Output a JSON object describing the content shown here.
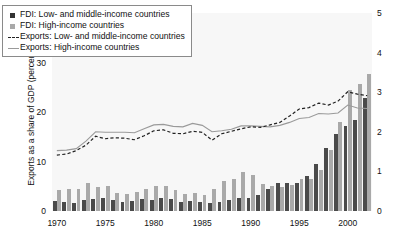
{
  "figure": {
    "background": "#ffffff",
    "plot_background": "#f7f7f7"
  },
  "colors": {
    "fdi_low_middle": "#4a4a4a",
    "fdi_high": "#a9a9a9",
    "exports_low_middle": "#222222",
    "exports_high": "#9a9a9a"
  },
  "legend": {
    "items": [
      {
        "label": "FDI: Low- and middle-income countries",
        "marker": "square-dark-icon"
      },
      {
        "label": "FDI: High-income countries",
        "marker": "square-light-icon"
      },
      {
        "label": "Exports: Low- and middle-income countries",
        "marker": "dashed-line-icon"
      },
      {
        "label": "Exports: High-income countries",
        "marker": "solid-line-icon"
      }
    ]
  },
  "footnote": {
    "text": ""
  },
  "chart_data": {
    "type": "bar",
    "title": "",
    "subtitle": "",
    "xlabel": "",
    "ylabel": "Exports as a share of GDP (percent)",
    "y2label": "FDI as a share of GDP (percent)",
    "ylim": [
      0,
      40
    ],
    "y2lim": [
      0,
      5
    ],
    "yticks": [
      0,
      10,
      20,
      30,
      40
    ],
    "y2ticks": [
      0,
      1,
      2,
      3,
      4,
      5
    ],
    "xticks": [
      1970,
      1975,
      1980,
      1985,
      1990,
      1995,
      2000
    ],
    "grid": false,
    "legend_position": "upper-left",
    "x": [
      1970,
      1971,
      1972,
      1973,
      1974,
      1975,
      1976,
      1977,
      1978,
      1979,
      1980,
      1981,
      1982,
      1983,
      1984,
      1985,
      1986,
      1987,
      1988,
      1989,
      1990,
      1991,
      1992,
      1993,
      1994,
      1995,
      1996,
      1997,
      1998,
      1999,
      2000,
      2001,
      2002
    ],
    "series": [
      {
        "name": "FDI: Low- and middle-income countries",
        "type": "bar",
        "axis": "right",
        "unit": "percent of GDP",
        "values": [
          0.25,
          0.22,
          0.2,
          0.28,
          0.3,
          0.33,
          0.28,
          0.24,
          0.26,
          0.3,
          0.27,
          0.32,
          0.3,
          0.22,
          0.25,
          0.23,
          0.2,
          0.22,
          0.27,
          0.32,
          0.33,
          0.4,
          0.55,
          0.7,
          0.72,
          0.7,
          0.88,
          1.18,
          1.6,
          1.95,
          2.15,
          2.3,
          2.85
        ]
      },
      {
        "name": "FDI: High-income countries",
        "type": "bar",
        "axis": "right",
        "unit": "percent of GDP",
        "values": [
          0.52,
          0.56,
          0.55,
          0.72,
          0.6,
          0.62,
          0.45,
          0.42,
          0.48,
          0.55,
          0.62,
          0.62,
          0.52,
          0.42,
          0.45,
          0.4,
          0.55,
          0.75,
          0.82,
          0.98,
          0.9,
          0.68,
          0.62,
          0.6,
          0.65,
          0.8,
          0.82,
          1.03,
          1.55,
          2.25,
          3.05,
          3.2,
          3.45
        ]
      },
      {
        "name": "Exports: Low- and middle-income countries",
        "type": "line",
        "style": "dashed",
        "axis": "left",
        "unit": "percent of GDP",
        "values": [
          11.3,
          11.5,
          12.2,
          13.3,
          15.1,
          14.6,
          14.8,
          14.7,
          14.4,
          15.2,
          16.2,
          16.4,
          15.7,
          15.6,
          16.1,
          15.9,
          14.3,
          15.6,
          16.1,
          16.6,
          17.0,
          16.9,
          17.4,
          17.9,
          19.2,
          20.6,
          20.9,
          21.8,
          21.4,
          22.2,
          24.1,
          23.6,
          23.3
        ]
      },
      {
        "name": "Exports: High-income countries",
        "type": "line",
        "style": "solid",
        "axis": "left",
        "unit": "percent of GDP",
        "values": [
          12.2,
          12.3,
          12.6,
          14.1,
          16.0,
          15.9,
          15.9,
          15.9,
          15.8,
          16.6,
          17.4,
          17.5,
          17.1,
          17.0,
          17.7,
          17.3,
          16.0,
          16.2,
          16.5,
          17.2,
          17.2,
          17.1,
          17.0,
          17.3,
          17.9,
          18.7,
          18.9,
          19.7,
          19.6,
          19.8,
          21.4,
          20.8,
          20.7
        ]
      }
    ]
  }
}
